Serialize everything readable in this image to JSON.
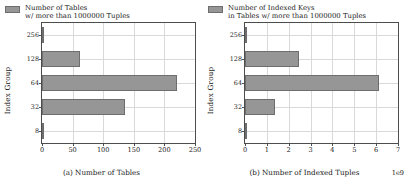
{
  "chart_data": [
    {
      "type": "bar",
      "orientation": "horizontal",
      "panel_label": "(a)",
      "caption": "(a) Number of Tables",
      "title": "",
      "xlabel": "",
      "ylabel": "Index Group",
      "legend": {
        "position": "upper right",
        "entries": [
          {
            "line1": "Number of Tables",
            "line2": "w/ more than 1000000 Tuples"
          }
        ]
      },
      "categories": [
        "8",
        "32",
        "64",
        "128",
        "256"
      ],
      "values": [
        1,
        135,
        221,
        62,
        2
      ],
      "xticks": [
        "0",
        "50",
        "100",
        "150",
        "200",
        "250"
      ],
      "xtickvalues": [
        0,
        50,
        100,
        150,
        200,
        250
      ],
      "xlim": [
        0,
        250
      ],
      "yticks": [
        "8",
        "32",
        "64",
        "128",
        "256"
      ],
      "grid": true,
      "exponent": "",
      "bar_color": "#969696",
      "bar_edge_color": "#6e6e6e",
      "grid_color": "#d9d9d9",
      "axes_color": "#4d4d4d"
    },
    {
      "type": "bar",
      "orientation": "horizontal",
      "panel_label": "(b)",
      "caption": "(b) Number of Indexed Tuples",
      "title": "",
      "xlabel": "",
      "ylabel": "Index Group",
      "legend": {
        "position": "upper right",
        "entries": [
          {
            "line1": "Number of Indexed Keys",
            "line2": "in Tables w/ more than 1000000 Tuples"
          }
        ]
      },
      "categories": [
        "8",
        "32",
        "64",
        "128",
        "256"
      ],
      "values": [
        0.02,
        1.38,
        6.15,
        2.48,
        0.03
      ],
      "xticks": [
        "0",
        "1",
        "2",
        "3",
        "4",
        "5",
        "6",
        "7"
      ],
      "xtickvalues": [
        0,
        1,
        2,
        3,
        4,
        5,
        6,
        7
      ],
      "xlim": [
        0,
        7
      ],
      "yticks": [
        "8",
        "32",
        "64",
        "128",
        "256"
      ],
      "grid": true,
      "exponent": "1e9",
      "bar_color": "#969696",
      "bar_edge_color": "#6e6e6e",
      "grid_color": "#d9d9d9",
      "axes_color": "#4d4d4d"
    }
  ]
}
